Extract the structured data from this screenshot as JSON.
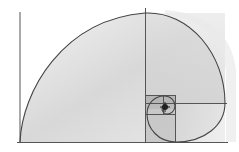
{
  "illustration": {
    "subject": "golden-spiral",
    "title": "Fibonacci golden spiral sketch",
    "colors": {
      "background": "#ffffff",
      "line": "#4a4a4a",
      "shade_light": "#e6e6e6",
      "shade_mid": "#cfcfcf",
      "shade_dark": "#9a9a9a",
      "center_mark": "#222222"
    }
  }
}
